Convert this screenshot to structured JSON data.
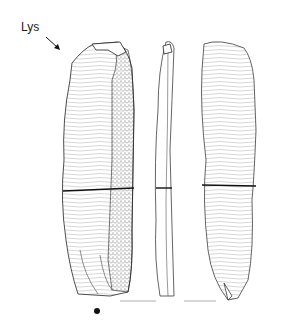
{
  "figure": {
    "label": "Lys",
    "views": [
      "dorsal-face",
      "profile",
      "ventral-face"
    ],
    "annotations": {
      "arrow": "light-direction-arrow",
      "dot": "orientation-dot",
      "scale": "scale-lines"
    }
  }
}
